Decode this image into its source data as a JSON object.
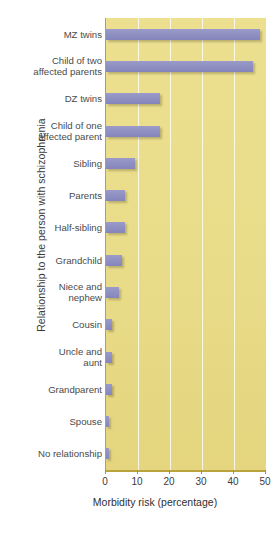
{
  "chart_data": {
    "type": "bar",
    "orientation": "horizontal",
    "title": "",
    "xlabel": "Morbidity risk (percentage)",
    "ylabel": "Relationship to the person with schizophrenia",
    "xlim": [
      0,
      50
    ],
    "xticks": [
      0,
      10,
      20,
      30,
      40,
      50
    ],
    "xtick_labels": [
      "0",
      "10",
      "20",
      "30",
      "40",
      "50"
    ],
    "grid": true,
    "grid_axis": "x",
    "legend": null,
    "categories": [
      "MZ twins",
      "Child of two\naffected parents",
      "DZ twins",
      "Child of one\naffected parent",
      "Sibling",
      "Parents",
      "Half-sibling",
      "Grandchild",
      "Niece and\nnephew",
      "Cousin",
      "Uncle and\naunt",
      "Grandparent",
      "Spouse",
      "No relationship"
    ],
    "values": [
      48,
      46,
      17,
      17,
      9,
      6,
      6,
      5,
      4,
      2,
      2,
      2,
      1,
      1
    ],
    "bar_color": "#8f90c2",
    "plot_background": "#ecdf8f",
    "gridline_color": "#ffffff",
    "axis_color": "#b8a33c"
  }
}
